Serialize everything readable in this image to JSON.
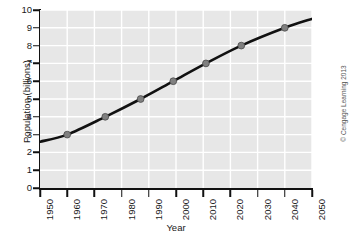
{
  "chart_data": {
    "type": "line",
    "title": "",
    "xlabel": "Year",
    "ylabel": "Population (billions)",
    "xlim": [
      1950,
      2050
    ],
    "ylim": [
      0,
      10
    ],
    "grid": true,
    "legend": false,
    "xticks": [
      1950,
      1960,
      1970,
      1980,
      1990,
      2000,
      2010,
      2020,
      2030,
      2040,
      2050
    ],
    "xtick_labels": [
      "1950",
      "1960",
      "1970",
      "1980",
      "1990",
      "2000",
      "2010",
      "2020",
      "2030",
      "2040",
      "2050"
    ],
    "yticks": [
      0,
      1,
      2,
      3,
      4,
      5,
      6,
      7,
      8,
      9,
      10
    ],
    "ytick_labels": [
      "0",
      "1",
      "2",
      "3",
      "4",
      "5",
      "6",
      "7",
      "8",
      "9",
      "10"
    ],
    "series": [
      {
        "name": "World population",
        "line_color": "#111111",
        "marker_color": "#808080",
        "x": [
          1950,
          1960,
          1974,
          1987,
          1999,
          2011,
          2024,
          2040,
          2050
        ],
        "y": [
          2.6,
          3.0,
          4.0,
          5.0,
          6.0,
          7.0,
          8.0,
          9.0,
          9.5
        ],
        "marker_x": [
          1960,
          1974,
          1987,
          1999,
          2011,
          2024,
          2040
        ],
        "marker_y": [
          3.0,
          4.0,
          5.0,
          6.0,
          7.0,
          8.0,
          9.0
        ]
      }
    ]
  },
  "credit": "© Cengage Learning 2013",
  "colors": {
    "plot_background": "#e7e7e7",
    "gridline": "#ffffff",
    "axis": "#111111",
    "text": "#1a1a1a"
  }
}
